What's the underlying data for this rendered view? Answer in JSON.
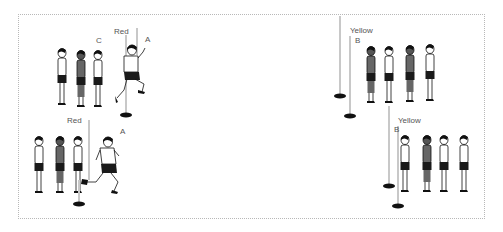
{
  "diagram": {
    "labels": {
      "top_left_red": "Red",
      "top_left_a": "A",
      "top_left_c": "C",
      "top_right_yellow": "Yellow",
      "top_right_b": "B",
      "bottom_left_red": "Red",
      "bottom_left_a": "A",
      "bottom_right_yellow": "Yellow",
      "bottom_right_b": "B"
    },
    "colors": {
      "border": "#b8b8b8",
      "pole": "#d0d0d0",
      "base": "#111111",
      "shorts": "#1a1a1a",
      "dark_skin": "#444444"
    },
    "groups": [
      {
        "name": "top-left",
        "pole": "Red",
        "standing_players": 3,
        "running_player": "A"
      },
      {
        "name": "top-right",
        "pole": "Yellow",
        "standing_players": 4
      },
      {
        "name": "bottom-left",
        "pole": "Red",
        "standing_players": 3,
        "running_player": "A"
      },
      {
        "name": "bottom-right",
        "pole": "Yellow",
        "standing_players": 4
      }
    ]
  }
}
